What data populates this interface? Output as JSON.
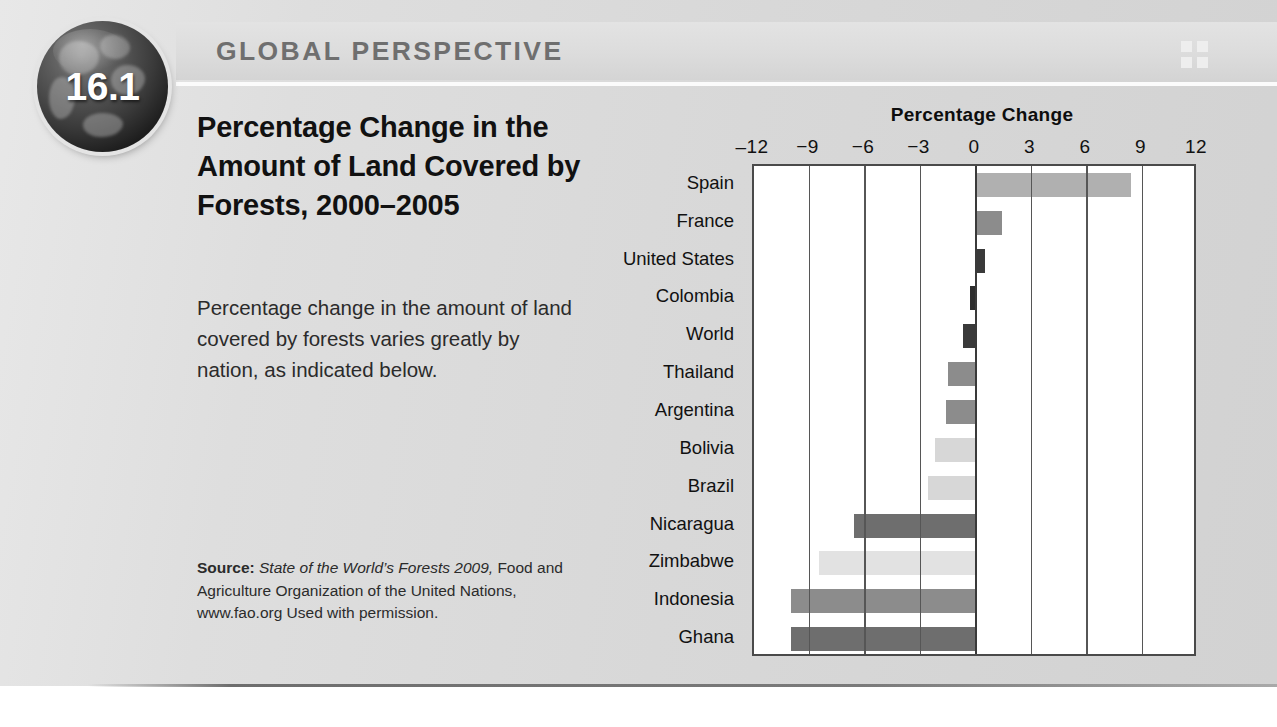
{
  "header": {
    "banner_title": "GLOBAL PERSPECTIVE",
    "badge_number": "16.1",
    "corner_icon": "grid-2x2-icon"
  },
  "figure": {
    "title": "Percentage Change in the Amount of Land Covered by Forests, 2000–2005",
    "description": "Percentage change in the amount of land covered by forests varies greatly by nation, as indicated below.",
    "source_label": "Source:",
    "source_italic": "State of the World’s Forests 2009,",
    "source_rest": "Food and Agriculture Organization of the United Nations, www.fao.org Used with permission."
  },
  "colors": {
    "panel_background": "#dcdcdc",
    "banner_background": "#dcdcdc",
    "banner_text": "#6f6f6f",
    "plot_background": "#ffffff",
    "axis": "#4a4a4a",
    "gridline": "#565656",
    "bar_light": "#d7d7d7",
    "bar_mid_light": "#b0b0b0",
    "bar_mid": "#8c8c8c",
    "bar_dark": "#6e6e6e",
    "bar_darkest": "#3a3a3a"
  },
  "chart_data": {
    "type": "bar",
    "orientation": "horizontal",
    "title": "Percentage Change",
    "xlabel": "Percentage Change",
    "ylabel": "",
    "xlim": [
      -12,
      12
    ],
    "xticks": [
      -12,
      -9,
      -6,
      -3,
      0,
      3,
      6,
      9,
      12
    ],
    "xtick_labels": [
      "‒12",
      "−9",
      "−6",
      "−3",
      "0",
      "3",
      "6",
      "9",
      "12"
    ],
    "grid": true,
    "legend": "none",
    "categories": [
      "Spain",
      "France",
      "United States",
      "Colombia",
      "World",
      "Thailand",
      "Argentina",
      "Bolivia",
      "Brazil",
      "Nicaragua",
      "Zimbabwe",
      "Indonesia",
      "Ghana"
    ],
    "values": [
      8.4,
      1.4,
      0.5,
      -0.3,
      -0.7,
      -1.5,
      -1.6,
      -2.2,
      -2.6,
      -6.6,
      -8.5,
      -10.0,
      -10.0
    ],
    "bar_colors": [
      "#b0b0b0",
      "#8c8c8c",
      "#3a3a3a",
      "#2e2e2e",
      "#3a3a3a",
      "#8c8c8c",
      "#8c8c8c",
      "#d7d7d7",
      "#d7d7d7",
      "#6e6e6e",
      "#e2e2e2",
      "#8c8c8c",
      "#6e6e6e"
    ]
  }
}
